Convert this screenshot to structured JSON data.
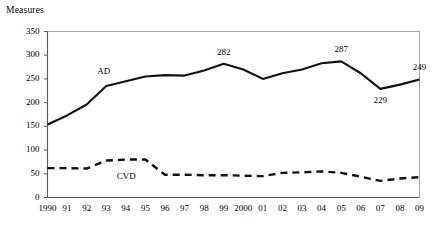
{
  "chart_data": {
    "type": "line",
    "title": "",
    "ylabel": "Measures",
    "xlabel": "",
    "ylim": [
      0,
      350
    ],
    "yticks": [
      0,
      50,
      100,
      150,
      200,
      250,
      300,
      350
    ],
    "ytick_labels": [
      "0",
      "50",
      "100",
      "150",
      "200",
      "250",
      "300",
      "350"
    ],
    "grid": false,
    "legend_position": "inline-annotation",
    "categories": [
      "1990",
      "91",
      "92",
      "93",
      "94",
      "95",
      "96",
      "97",
      "98",
      "99",
      "2000",
      "01",
      "02",
      "03",
      "04",
      "05",
      "06",
      "07",
      "08",
      "09"
    ],
    "series": [
      {
        "name": "AD",
        "style": "solid",
        "color": "#111111",
        "values": [
          154,
          173,
          196,
          235,
          245,
          255,
          258,
          257,
          268,
          282,
          270,
          250,
          262,
          270,
          283,
          287,
          262,
          229,
          238,
          249
        ]
      },
      {
        "name": "CVD",
        "style": "dashed",
        "color": "#111111",
        "values": [
          62,
          62,
          61,
          78,
          80,
          80,
          48,
          48,
          47,
          47,
          46,
          45,
          52,
          53,
          55,
          52,
          44,
          35,
          40,
          43
        ]
      }
    ],
    "point_labels": [
      {
        "series": "AD",
        "category": "99",
        "value": 282,
        "text": "282",
        "position": "above"
      },
      {
        "series": "AD",
        "category": "05",
        "value": 287,
        "text": "287",
        "position": "above"
      },
      {
        "series": "AD",
        "category": "07",
        "value": 229,
        "text": "229",
        "position": "below"
      },
      {
        "series": "AD",
        "category": "09",
        "value": 249,
        "text": "249",
        "position": "above"
      }
    ],
    "series_annotations": [
      {
        "text": "AD",
        "series": "AD",
        "near_category": "93"
      },
      {
        "text": "CVD",
        "series": "CVD",
        "near_category": "94"
      }
    ],
    "colors": {
      "line": "#111111",
      "frame": "#a8a8a8",
      "axis": "#5a5a5a",
      "background": "#ffffff"
    }
  }
}
